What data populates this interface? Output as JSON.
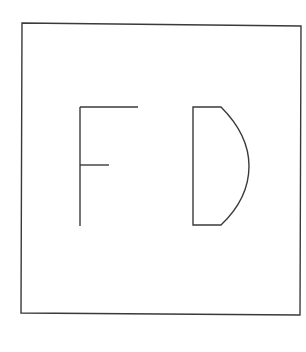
{
  "drawing": {
    "letters": [
      "F",
      "D"
    ],
    "stroke_color": "#3a3a3a",
    "background": "#ffffff"
  }
}
